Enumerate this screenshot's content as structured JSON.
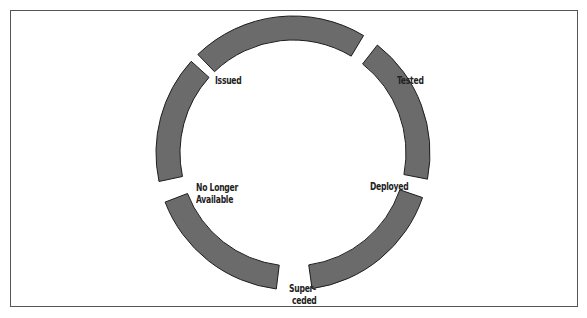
{
  "figure": {
    "caption_partial": "Figure ... lifecycle",
    "colors": {
      "segment_fill": "#6b6b6b",
      "segment_stroke": "#1e1e1e",
      "frame": "#555555",
      "background": "#ffffff"
    }
  },
  "cycle": {
    "center": [
      293,
      153
    ],
    "outer_radius": 137,
    "inner_radius": 113,
    "segments": [
      {
        "name": "top",
        "start_deg": -44,
        "end_deg": 31
      },
      {
        "name": "tested-to-deployed",
        "start_deg": 38,
        "end_deg": 101
      },
      {
        "name": "deployed-to-superceded",
        "start_deg": 109,
        "end_deg": 172
      },
      {
        "name": "superceded-to-no-longer",
        "start_deg": 187,
        "end_deg": 249
      },
      {
        "name": "no-longer-to-issued",
        "start_deg": 258,
        "end_deg": 312
      }
    ],
    "labels": [
      {
        "id": "issued",
        "text": "Issued"
      },
      {
        "id": "tested",
        "text": "Tested"
      },
      {
        "id": "deployed",
        "text": "Deployed"
      },
      {
        "id": "superceded_line1",
        "text": "Super-"
      },
      {
        "id": "superceded_line2",
        "text": "ceded"
      },
      {
        "id": "no_longer_line1",
        "text": "No Longer"
      },
      {
        "id": "no_longer_line2",
        "text": "Available"
      }
    ]
  }
}
